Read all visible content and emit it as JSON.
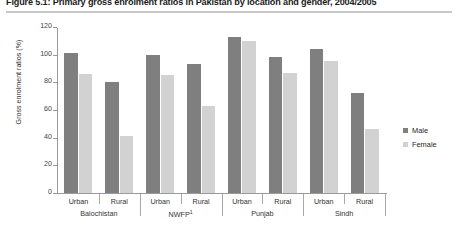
{
  "figure": {
    "title": "Figure 5.1: Primary gross enrolment ratios in Pakistan by location and gender, 2004/2005"
  },
  "legend": {
    "position": "right",
    "items": [
      {
        "label": "Male",
        "color": "#7f7f7f",
        "swatch_name": "male-swatch"
      },
      {
        "label": "Female",
        "color": "#d2d2d2",
        "swatch_name": "female-swatch"
      }
    ]
  },
  "axes": {
    "ylabel": "Gross enrolment ratios (%)",
    "yticks": [
      "0",
      "20",
      "40",
      "60",
      "80",
      "100",
      "120"
    ],
    "ymin": 0,
    "ymax": 120
  },
  "groups": [
    {
      "name": "Balochistan",
      "footnote": ""
    },
    {
      "name": "NWFP",
      "footnote": "1"
    },
    {
      "name": "Punjab",
      "footnote": ""
    },
    {
      "name": "Sindh",
      "footnote": ""
    }
  ],
  "locations": [
    "Urban",
    "Rural",
    "Urban",
    "Rural",
    "Urban",
    "Rural",
    "Urban",
    "Rural"
  ],
  "chart_data": {
    "type": "bar",
    "title": "Figure 5.1: Primary gross enrolment ratios in Pakistan by location and gender, 2004/2005",
    "xlabel": "",
    "ylabel": "Gross enrolment ratios (%)",
    "ylim": [
      0,
      120
    ],
    "yticks": [
      0,
      20,
      40,
      60,
      80,
      100,
      120
    ],
    "grid": false,
    "legend_position": "right",
    "categories": [
      "Balochistan Urban",
      "Balochistan Rural",
      "NWFP Urban",
      "NWFP Rural",
      "Punjab Urban",
      "Punjab Rural",
      "Sindh Urban",
      "Sindh Rural"
    ],
    "group_names": [
      "Balochistan",
      "NWFP",
      "Punjab",
      "Sindh"
    ],
    "subcategories": [
      "Urban",
      "Rural",
      "Urban",
      "Rural",
      "Urban",
      "Rural",
      "Urban",
      "Rural"
    ],
    "series": [
      {
        "name": "Male",
        "color": "#7f7f7f",
        "values": [
          101,
          80,
          100,
          93,
          113,
          98,
          104,
          72
        ]
      },
      {
        "name": "Female",
        "color": "#d2d2d2",
        "values": [
          86,
          41,
          85,
          63,
          110,
          87,
          95,
          46
        ]
      }
    ]
  }
}
